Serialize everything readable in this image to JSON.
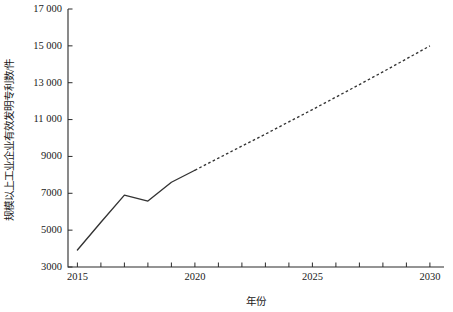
{
  "chart_data": {
    "type": "line",
    "title": "",
    "xlabel": "年份",
    "ylabel": "规模以上工业企业有效发明专利数/件",
    "xlim": [
      2014.6,
      2030.6
    ],
    "ylim": [
      3000,
      17000
    ],
    "grid": false,
    "legend": null,
    "x_ticks": [
      2015,
      2016,
      2017,
      2018,
      2019,
      2020,
      2021,
      2022,
      2023,
      2024,
      2025,
      2026,
      2027,
      2028,
      2029,
      2030
    ],
    "x_tick_labels": [
      "2015",
      "",
      "",
      "",
      "",
      "2020",
      "",
      "",
      "",
      "",
      "2025",
      "",
      "",
      "",
      "",
      "2030"
    ],
    "y_ticks": [
      3000,
      5000,
      7000,
      9000,
      11000,
      13000,
      15000,
      17000
    ],
    "y_tick_labels": [
      "3000",
      "5000",
      "7000",
      "9000",
      "11 000",
      "13 000",
      "15 000",
      "17 000"
    ],
    "series": [
      {
        "name": "历史值",
        "style": "solid",
        "x": [
          2015,
          2016,
          2017,
          2018,
          2019,
          2020
        ],
        "values": [
          3920,
          5430,
          6900,
          6580,
          7600,
          8250
        ]
      },
      {
        "name": "预测值",
        "style": "dashed",
        "x": [
          2020,
          2021,
          2022,
          2023,
          2024,
          2025,
          2026,
          2027,
          2028,
          2029,
          2030
        ],
        "values": [
          8250,
          8910,
          9560,
          10210,
          10880,
          11540,
          12220,
          12900,
          13590,
          14290,
          15000
        ]
      }
    ],
    "colors": {
      "line": "#333333",
      "axis": "#2b2b2b",
      "background": "#ffffff",
      "text": "#1a1a1a"
    }
  }
}
